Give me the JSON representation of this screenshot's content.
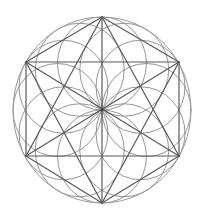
{
  "figure": {
    "title": "",
    "background": "#ffffff",
    "center": [
      102,
      110
    ],
    "radius_x": 89,
    "radius_y": 93,
    "colors": {
      "outer_circle": "#9a9a9a",
      "petal_circles": "#8a8a8a",
      "lines": "#5a5a5a",
      "center_dot": "#333333"
    },
    "stroke_widths": {
      "outer_circle": 1.0,
      "petal_circles": 0.9,
      "lines": 1.2
    },
    "vertices": {
      "top": [
        102,
        17
      ],
      "upper_right": [
        179,
        62
      ],
      "lower_right": [
        179,
        156
      ],
      "bottom": [
        102,
        203
      ],
      "lower_left": [
        26,
        156
      ],
      "upper_left": [
        26,
        62
      ]
    },
    "petal_circle_count": 12,
    "petal_circle_angles_deg": [
      0,
      30,
      60,
      90,
      120,
      150,
      180,
      210,
      240,
      270,
      300,
      330
    ],
    "lines": [
      {
        "name": "hexagon-edge-top-ur",
        "from": "top",
        "to": "upper_right"
      },
      {
        "name": "hexagon-edge-ur-lr",
        "from": "upper_right",
        "to": "lower_right"
      },
      {
        "name": "hexagon-edge-lr-bottom",
        "from": "lower_right",
        "to": "bottom"
      },
      {
        "name": "hexagon-edge-bottom-ll",
        "from": "bottom",
        "to": "lower_left"
      },
      {
        "name": "hexagon-edge-ll-ul",
        "from": "lower_left",
        "to": "upper_left"
      },
      {
        "name": "hexagon-edge-ul-top",
        "from": "upper_left",
        "to": "top"
      },
      {
        "name": "rectangle-top-edge",
        "from": "upper_left",
        "to": "upper_right"
      },
      {
        "name": "rectangle-bottom-edge",
        "from": "lower_left",
        "to": "lower_right"
      },
      {
        "name": "vertical-axis",
        "from": "top",
        "to": "bottom"
      },
      {
        "name": "diagonal-ul-lr",
        "from": "upper_left",
        "to": "lower_right"
      },
      {
        "name": "diagonal-ur-ll",
        "from": "upper_right",
        "to": "lower_left"
      },
      {
        "name": "hexagram-top-ll",
        "from": "top",
        "to": "lower_left"
      },
      {
        "name": "hexagram-top-lr",
        "from": "top",
        "to": "lower_right"
      },
      {
        "name": "hexagram-bottom-ul",
        "from": "bottom",
        "to": "upper_left"
      },
      {
        "name": "hexagram-bottom-ur",
        "from": "bottom",
        "to": "upper_right"
      }
    ]
  }
}
